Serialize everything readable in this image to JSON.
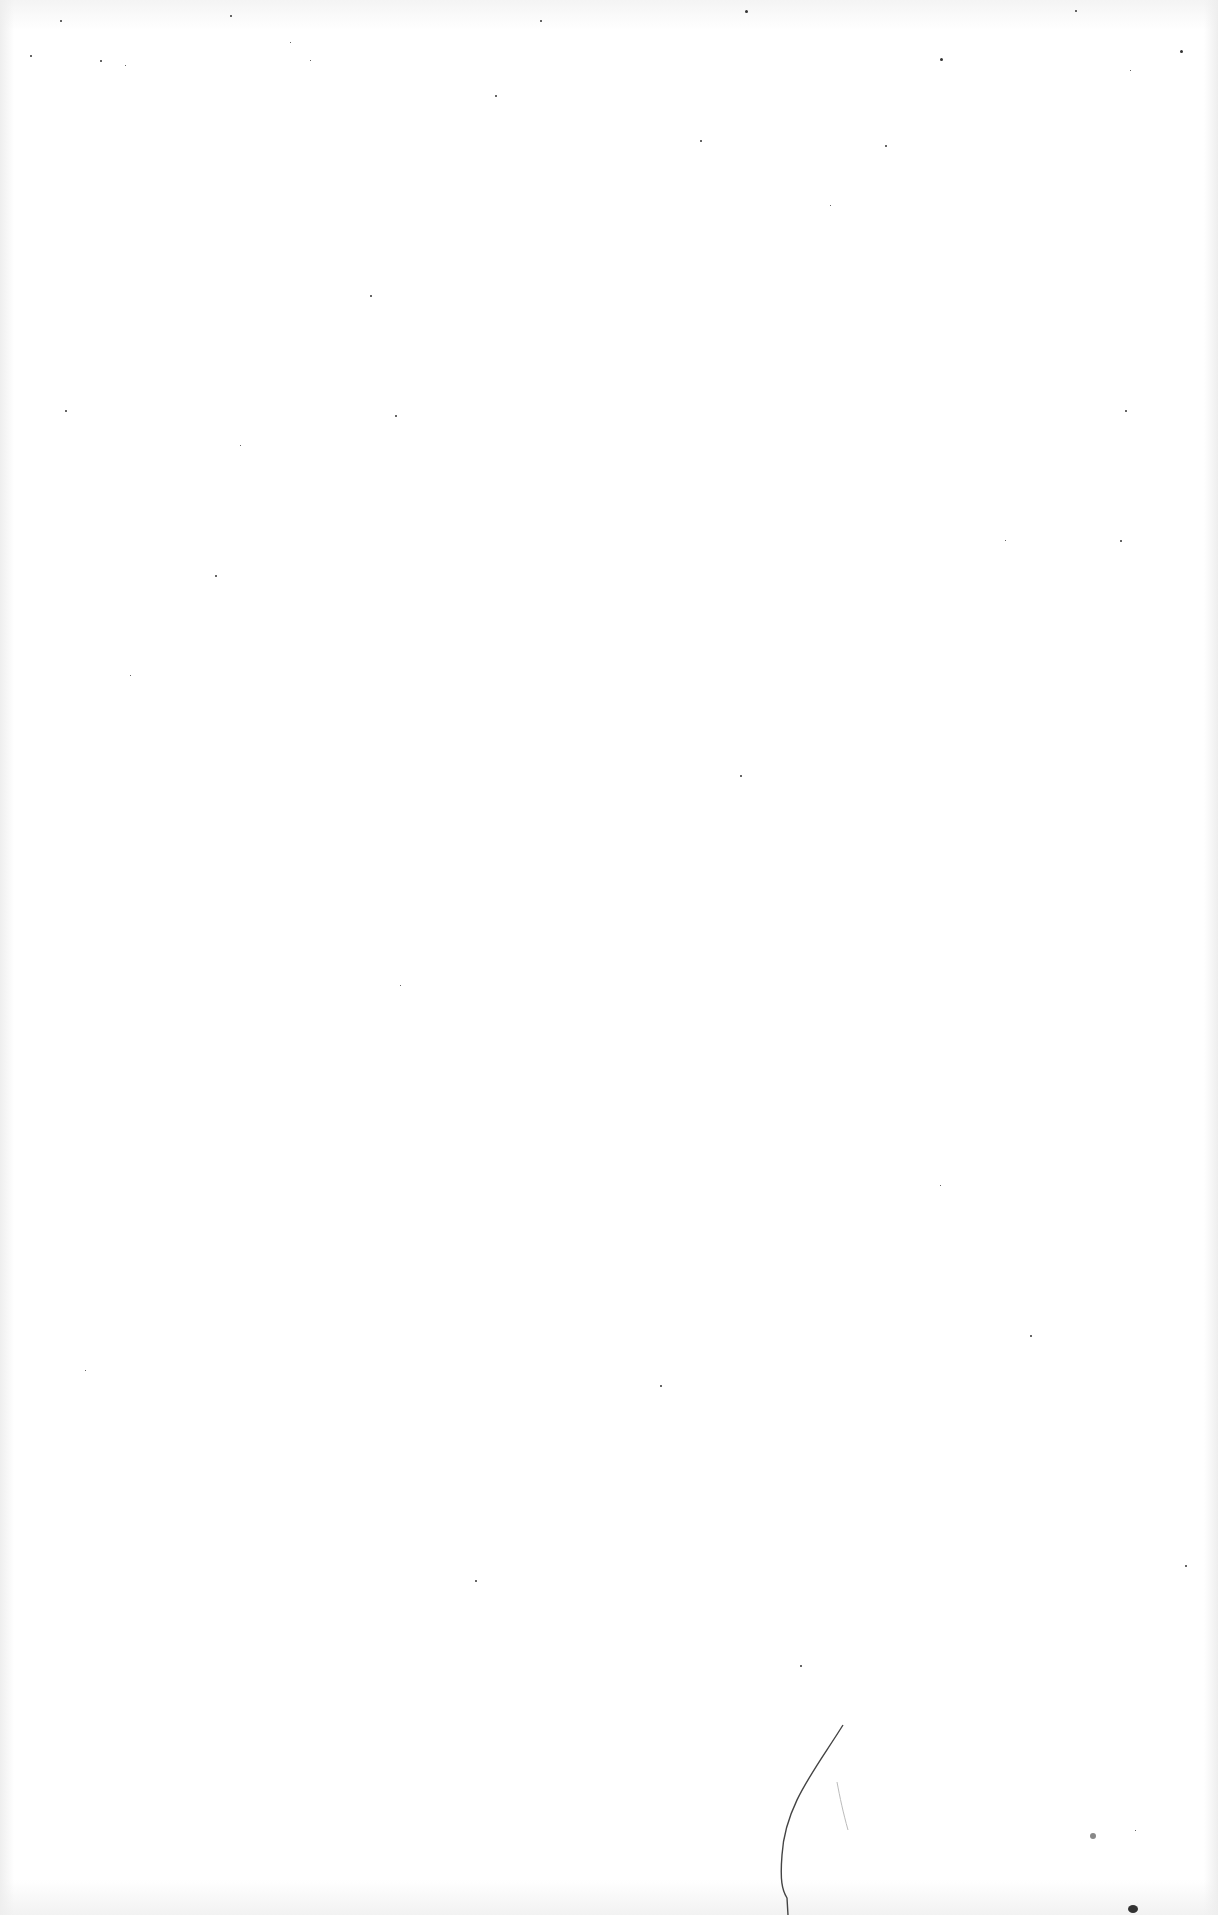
{
  "page": {
    "type": "blank-scanned-page",
    "text": "",
    "background_color": "#ffffff",
    "speck_color": "#333333"
  },
  "specks": [
    [
      30,
      55,
      2
    ],
    [
      60,
      20,
      2
    ],
    [
      100,
      60,
      2
    ],
    [
      125,
      65,
      1
    ],
    [
      230,
      15,
      2
    ],
    [
      290,
      42,
      1
    ],
    [
      310,
      60,
      1
    ],
    [
      495,
      95,
      2
    ],
    [
      540,
      20,
      2
    ],
    [
      745,
      10,
      3
    ],
    [
      940,
      58,
      3
    ],
    [
      1075,
      10,
      2
    ],
    [
      1130,
      70,
      1
    ],
    [
      700,
      140,
      2
    ],
    [
      885,
      145,
      2
    ],
    [
      1180,
      50,
      3
    ],
    [
      830,
      205,
      1
    ],
    [
      370,
      295,
      2
    ],
    [
      65,
      410,
      2
    ],
    [
      395,
      415,
      2
    ],
    [
      240,
      445,
      1
    ],
    [
      1125,
      410,
      2
    ],
    [
      215,
      575,
      2
    ],
    [
      1005,
      540,
      1
    ],
    [
      1120,
      540,
      2
    ],
    [
      740,
      775,
      2
    ],
    [
      130,
      675,
      1
    ],
    [
      400,
      985,
      1
    ],
    [
      660,
      1385,
      2
    ],
    [
      85,
      1370,
      1
    ],
    [
      475,
      1580,
      2
    ],
    [
      800,
      1665,
      2
    ],
    [
      1185,
      1565,
      2
    ],
    [
      940,
      1185,
      1
    ],
    [
      1030,
      1335,
      2
    ],
    [
      1135,
      1830,
      1
    ]
  ]
}
